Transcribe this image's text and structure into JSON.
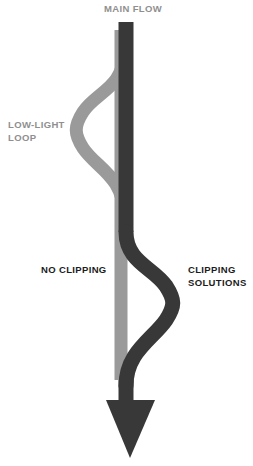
{
  "diagram": {
    "title": "MAIN FLOW",
    "type": "flow-branch-diagram",
    "canvas": {
      "width": 253,
      "height": 466,
      "background": "#ffffff"
    },
    "colors": {
      "main_flow": "#383838",
      "secondary_flow": "#9a9a9a",
      "label_dark": "#1c1c1c",
      "label_gray": "#8f8f8f",
      "background": "#ffffff"
    },
    "labels": {
      "main_flow": "MAIN FLOW",
      "low_light_loop": "LOW-LIGHT\nLOOP",
      "no_clipping": "NO CLIPPING",
      "clipping_solutions": "CLIPPING\nSOLUTIONS"
    },
    "paths": [
      {
        "name": "main-flow-stem",
        "color": "#383838",
        "direction": "downward",
        "has_arrowhead": true,
        "stroke_width": 15
      },
      {
        "name": "low-light-loop-branch",
        "color": "#9a9a9a",
        "side": "left",
        "stroke_width": 13
      },
      {
        "name": "clipping-solutions-branch",
        "color": "#383838",
        "side": "right",
        "stroke_width": 13
      }
    ]
  }
}
